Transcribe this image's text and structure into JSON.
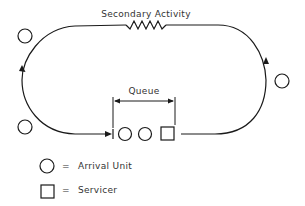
{
  "diagram": {
    "top_label": "Secondary Activity",
    "queue_label": "Queue",
    "legend": [
      {
        "symbol": "circle",
        "equals": "=",
        "label": "Arrival Unit"
      },
      {
        "symbol": "square",
        "equals": "=",
        "label": "Servicer"
      }
    ],
    "colors": {
      "stroke": "#1a1a1a",
      "text": "#333333",
      "background": "#ffffff"
    }
  }
}
